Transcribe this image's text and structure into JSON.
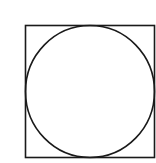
{
  "diagram": {
    "square": {
      "x": 25.5,
      "y": 25.5,
      "width": 129,
      "height": 132,
      "stroke": "#1a1a1a",
      "stroke_width": 1.6
    },
    "circle": {
      "cx": 90,
      "cy": 91.5,
      "rx": 64.5,
      "ry": 66,
      "stroke": "#1a1a1a",
      "stroke_width": 1.6
    },
    "background": "#ffffff"
  }
}
